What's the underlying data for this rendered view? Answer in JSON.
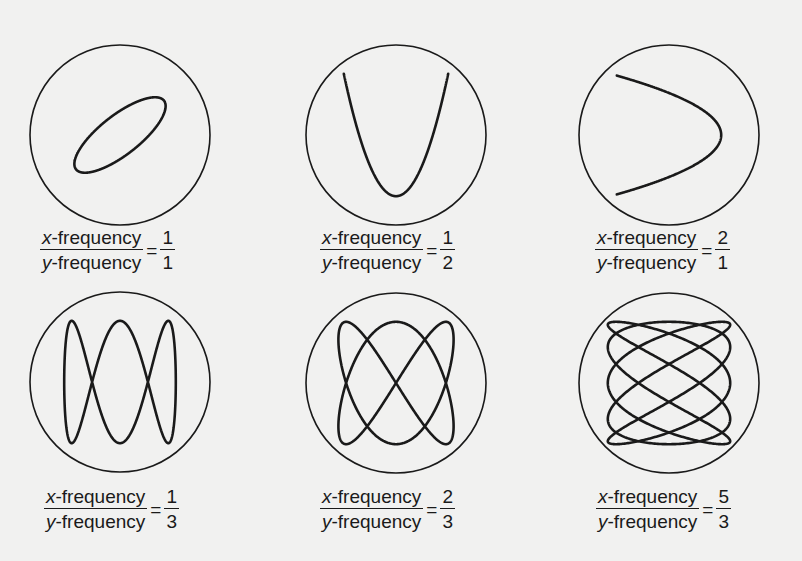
{
  "figure": {
    "label_numerator_var": "x",
    "label_numerator_rest": "-frequency",
    "label_denominator_var": "y",
    "label_denominator_rest": "-frequency",
    "equals": "=",
    "panels": [
      {
        "id": "p1",
        "ratio_num": "1",
        "ratio_den": "1",
        "a": 1,
        "b": 1,
        "phase_deg": 45,
        "cx": 120,
        "cy": 135,
        "r": 90,
        "ax": 0.5,
        "ay": 0.55,
        "tilt": true,
        "label_x": 40,
        "label_y": 228
      },
      {
        "id": "p2",
        "ratio_num": "1",
        "ratio_den": "2",
        "a": 1,
        "b": 2,
        "phase_deg": 0,
        "cx": 396,
        "cy": 135,
        "r": 90,
        "ax": 0.58,
        "ay": 0.68,
        "label_x": 320,
        "label_y": 228
      },
      {
        "id": "p3",
        "ratio_num": "2",
        "ratio_den": "1",
        "a": 2,
        "b": 1,
        "phase_deg": 0,
        "cx": 669,
        "cy": 135,
        "r": 90,
        "ax": 0.58,
        "ay": 0.66,
        "label_x": 595,
        "label_y": 228
      },
      {
        "id": "p4",
        "ratio_num": "1",
        "ratio_den": "3",
        "a": 1,
        "b": 3,
        "phase_deg": 90,
        "cx": 120,
        "cy": 382,
        "r": 90,
        "ax": 0.62,
        "ay": 0.68,
        "label_x": 44,
        "label_y": 487
      },
      {
        "id": "p5",
        "ratio_num": "2",
        "ratio_den": "3",
        "a": 2,
        "b": 3,
        "phase_deg": 90,
        "cx": 396,
        "cy": 383,
        "r": 90,
        "ax": 0.64,
        "ay": 0.68,
        "label_x": 320,
        "label_y": 487
      },
      {
        "id": "p6",
        "ratio_num": "5",
        "ratio_den": "3",
        "a": 5,
        "b": 3,
        "phase_deg": 90,
        "cx": 669,
        "cy": 383,
        "r": 90,
        "ax": 0.68,
        "ay": 0.68,
        "label_x": 596,
        "label_y": 487
      }
    ]
  },
  "colors": {
    "background": "#f1f1f0",
    "ink": "#1a1a1a"
  }
}
